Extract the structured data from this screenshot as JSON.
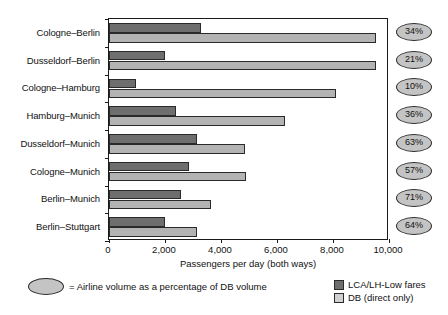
{
  "chart_data": {
    "type": "bar",
    "orientation": "horizontal",
    "title": "",
    "xlabel": "Passengers per day (both ways)",
    "ylabel": "",
    "xlim": [
      0,
      10000
    ],
    "xticks": [
      0,
      2000,
      4000,
      6000,
      8000,
      10000
    ],
    "xtick_labels": [
      "0",
      "2,000",
      "4,000",
      "6,000",
      "8,000",
      "10,000"
    ],
    "grid": false,
    "legend_position": "bottom-right",
    "categories": [
      "Cologne–Berlin",
      "Dusseldorf–Berlin",
      "Cologne–Hamburg",
      "Hamburg–Munich",
      "Dusseldorf–Munich",
      "Cologne–Munich",
      "Berlin–Munich",
      "Berlin–Stuttgart"
    ],
    "series": [
      {
        "name": "LCA/LH-Low fares",
        "color": "#6e6e6e",
        "values": [
          3300,
          2000,
          950,
          2400,
          3150,
          2850,
          2570,
          2000
        ]
      },
      {
        "name": "DB (direct only)",
        "color": "#b3b3b3",
        "values": [
          9550,
          9550,
          8100,
          6300,
          4850,
          4900,
          3650,
          3150
        ]
      }
    ],
    "annotations": {
      "label": "Airline volume as a percentage of DB volume",
      "values": [
        "34%",
        "21%",
        "10%",
        "36%",
        "63%",
        "57%",
        "71%",
        "64%"
      ]
    }
  },
  "caption": {
    "equals_sign": "=",
    "text": "= Airline volume as a percentage of DB volume"
  },
  "colors": {
    "dark_series": "#6e6e6e",
    "light_series": "#b3b3b3",
    "badge_fill": "#c4c4c4",
    "axis": "#1a1a1a"
  }
}
